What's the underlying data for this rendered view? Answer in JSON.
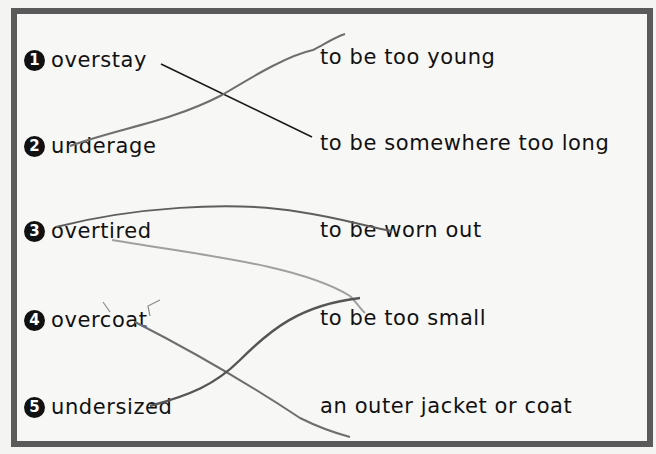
{
  "exercise": {
    "terms": [
      {
        "number": "1",
        "word": "overstay"
      },
      {
        "number": "2",
        "word": "underage"
      },
      {
        "number": "3",
        "word": "overtired"
      },
      {
        "number": "4",
        "word": "overcoat"
      },
      {
        "number": "5",
        "word": "undersized"
      }
    ],
    "definitions": [
      "to be too young",
      "to be somewhere too long",
      "to be worn out",
      "to be too small",
      "an outer jacket or coat"
    ],
    "drawn_matches": [
      {
        "term": "overstay",
        "definition": "to be somewhere too long",
        "stroke": "black-ink"
      },
      {
        "term": "underage",
        "definition": "to be too young",
        "stroke": "pencil"
      },
      {
        "term": "overtired",
        "definition": "to be worn out",
        "stroke": "pencil"
      },
      {
        "term": "overtired",
        "definition": "to be too small",
        "stroke": "light-pencil"
      },
      {
        "term": "overcoat",
        "definition": "an outer jacket or coat",
        "stroke": "pencil"
      },
      {
        "term": "undersized",
        "definition": "to be too small",
        "stroke": "pencil"
      }
    ]
  },
  "colors": {
    "frame_border": "#5a5a5a",
    "badge": "#111111",
    "ink_line": "#1a1a1a",
    "pencil_line": "#6e6e6e",
    "light_pencil_line": "#a0a0a0"
  }
}
